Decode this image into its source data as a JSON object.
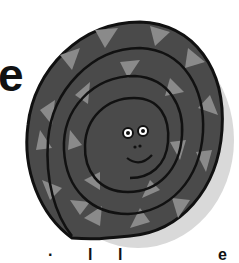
{
  "illustration": {
    "subject": "coiled snake with smiling face",
    "colors": {
      "body": "#4a4a4a",
      "scale_light": "#8a8a8a",
      "outline": "#111111",
      "shadow": "#d9d9d9",
      "eye_white": "#ffffff",
      "background": "#ffffff"
    }
  },
  "text_fragments": {
    "left_letter": "e",
    "bottom_left": "·",
    "bottom_mid1": "l",
    "bottom_mid2": "l",
    "bottom_right": "e"
  }
}
